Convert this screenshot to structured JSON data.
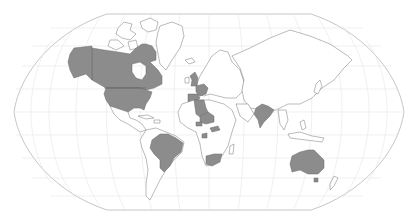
{
  "map": {
    "projection": "Robinson",
    "style": {
      "highlight_color": "#8c8c8c",
      "land_color": "#ffffff",
      "outline_color": "#777777",
      "graticule_color": "#e6e6e6",
      "frame_color": "#b8b8b8"
    },
    "highlighted_countries": [
      "United States",
      "Canada",
      "United Kingdom",
      "France",
      "Spain",
      "Algeria",
      "Niger",
      "Burkina Faso",
      "Central African Republic",
      "Gabon",
      "South Africa",
      "India",
      "Brazil",
      "Australia"
    ]
  }
}
